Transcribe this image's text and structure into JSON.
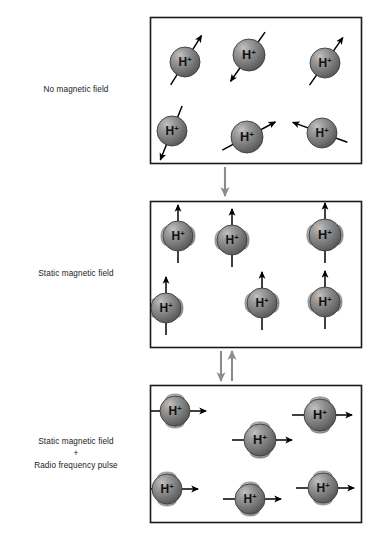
{
  "diagram": {
    "particle_label": "H",
    "particle_charge": "+",
    "colors": {
      "panel_border": "#1a1a1a",
      "panel_fill": "#ffffff",
      "sphere_dark": "#5d5d5d",
      "sphere_mid": "#858585",
      "sphere_light": "#b4b4b4",
      "sphere_edge": "#3c3c3c",
      "arc": "#9a9a9a",
      "arrow": "#000000",
      "connector_arrow": "#8c8c8c",
      "text": "#1a1a1a"
    },
    "panels": [
      {
        "id": "panel-no-field",
        "label_lines": [
          "No magnetic field"
        ],
        "frame": {
          "x": 150,
          "y": 17,
          "width": 211,
          "height": 146
        },
        "arrow_mode": "random",
        "has_precession_arc": false,
        "protons": [
          {
            "cx": 185,
            "cy": 62,
            "r": 15,
            "angle": -58
          },
          {
            "cx": 249,
            "cy": 55,
            "r": 16,
            "angle": 125
          },
          {
            "cx": 325,
            "cy": 63,
            "r": 15,
            "angle": -55
          },
          {
            "cx": 172,
            "cy": 131,
            "r": 15,
            "angle": 112
          },
          {
            "cx": 247,
            "cy": 137,
            "r": 16,
            "angle": -28
          },
          {
            "cx": 322,
            "cy": 133,
            "r": 15,
            "angle": 200
          }
        ]
      },
      {
        "id": "panel-static-field",
        "label_lines": [
          "Static magnetic field"
        ],
        "frame": {
          "x": 150,
          "y": 201,
          "width": 211,
          "height": 146
        },
        "arrow_mode": "vertical-up",
        "has_precession_arc": true,
        "protons": [
          {
            "cx": 178,
            "cy": 236,
            "r": 15,
            "angle": -90
          },
          {
            "cx": 232,
            "cy": 240,
            "r": 15,
            "angle": -90
          },
          {
            "cx": 325,
            "cy": 235,
            "r": 16,
            "angle": -90
          },
          {
            "cx": 166,
            "cy": 308,
            "r": 15,
            "angle": -90
          },
          {
            "cx": 262,
            "cy": 303,
            "r": 15,
            "angle": -90
          },
          {
            "cx": 325,
            "cy": 302,
            "r": 15,
            "angle": -90
          }
        ]
      },
      {
        "id": "panel-static-field-rf-pulse",
        "label_lines": [
          "Static magnetic field",
          "+",
          "Radio frequency pulse"
        ],
        "frame": {
          "x": 150,
          "y": 385,
          "width": 211,
          "height": 137
        },
        "arrow_mode": "horizontal-right",
        "has_precession_arc": true,
        "protons": [
          {
            "cx": 175,
            "cy": 411,
            "r": 15,
            "angle": 0
          },
          {
            "cx": 260,
            "cy": 440,
            "r": 16,
            "angle": 0
          },
          {
            "cx": 320,
            "cy": 415,
            "r": 16,
            "angle": 0
          },
          {
            "cx": 167,
            "cy": 489,
            "r": 15,
            "angle": 0
          },
          {
            "cx": 250,
            "cy": 499,
            "r": 15,
            "angle": 0
          },
          {
            "cx": 323,
            "cy": 488,
            "r": 15,
            "angle": 0
          }
        ]
      }
    ],
    "connectors": [
      {
        "id": "connector-top",
        "direction": "down",
        "arrows": [
          {
            "x": 225,
            "y1": 167,
            "y2": 196,
            "dir": "down"
          }
        ]
      },
      {
        "id": "connector-bottom",
        "direction": "bidirectional",
        "arrows": [
          {
            "x": 221,
            "y1": 351,
            "y2": 381,
            "dir": "down"
          },
          {
            "x": 232,
            "y1": 381,
            "y2": 351,
            "dir": "up"
          }
        ]
      }
    ]
  }
}
